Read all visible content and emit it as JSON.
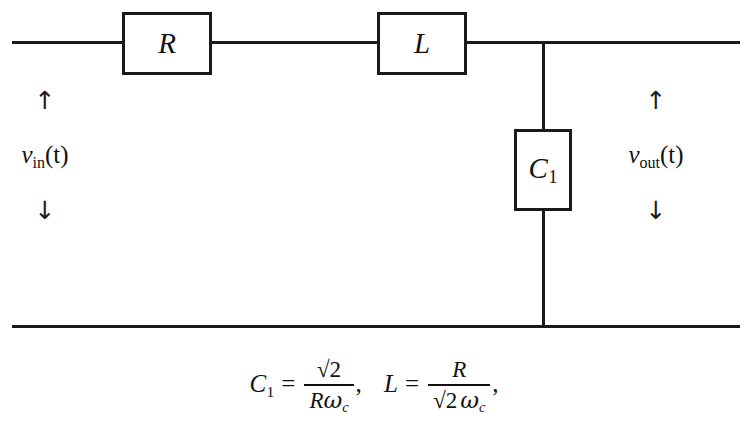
{
  "figure": {
    "type": "electrical-circuit-schematic",
    "background_color": "#ffffff",
    "line_color": "#1a1a1a"
  },
  "components": {
    "resistor": {
      "label": "R",
      "subscript": "",
      "orientation": "horizontal",
      "position": "series-top-branch-left"
    },
    "inductor": {
      "label": "L",
      "subscript": "",
      "orientation": "horizontal",
      "position": "series-top-branch-right"
    },
    "capacitor": {
      "label": "C",
      "subscript": "1",
      "orientation": "vertical",
      "position": "shunt-branch"
    }
  },
  "ports": {
    "input": {
      "arrow_up": "↑",
      "label_main": "v",
      "label_sub": "in",
      "label_arg": "(t)",
      "arrow_down": "↓"
    },
    "output": {
      "arrow_up": "↑",
      "label_main": "v",
      "label_sub": "out",
      "label_arg": "(t)",
      "arrow_down": "↓"
    }
  },
  "equations": {
    "capacitor_equation": {
      "lhs_var": "C",
      "lhs_sub": "1",
      "operator": "=",
      "numerator": "√2",
      "denominator_var": "R",
      "denominator_omega": "ω",
      "denominator_omega_sub": "c",
      "trailing": ","
    },
    "inductor_equation": {
      "lhs_var": "L",
      "operator": "=",
      "numerator": "R",
      "denominator_radical": "√2",
      "denominator_omega": "ω",
      "denominator_omega_sub": "c",
      "trailing": ","
    }
  }
}
